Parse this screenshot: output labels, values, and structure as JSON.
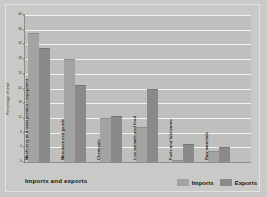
{
  "chart_data": {
    "type": "bar",
    "title": "Imports and exports",
    "xlabel": "",
    "ylabel": "Percentage of total",
    "ylim": [
      0,
      40
    ],
    "yticks": [
      0,
      4,
      8,
      12,
      16,
      20,
      24,
      28,
      32,
      36,
      40
    ],
    "ytick_labels": [
      "0",
      "4",
      "8",
      "12",
      "16",
      "20",
      "24",
      "28",
      "32",
      "36",
      "40"
    ],
    "grid": true,
    "legend_position": "bottom-right",
    "categories": [
      "Machinery and transportation equipment",
      "Manufactured goods",
      "Chemicals",
      "Live animals and food",
      "Fuels and lubricants",
      "Raw materials"
    ],
    "series": [
      {
        "name": "Imports",
        "color": "#a3a3a1",
        "values": [
          35,
          28,
          12,
          9.5,
          0.5,
          3
        ]
      },
      {
        "name": "Exports",
        "color": "#8a8a88",
        "values": [
          31,
          21,
          12.5,
          20,
          5,
          4
        ]
      }
    ]
  },
  "legend": {
    "items": [
      {
        "label": "Imports"
      },
      {
        "label": "Exports"
      }
    ]
  },
  "colors": {
    "imports": "#a3a3a1",
    "exports": "#8a8a88",
    "plot_background": "#bfbfbd",
    "figure_background": "#c9c9c7",
    "gridline": "#f2f2f0"
  }
}
